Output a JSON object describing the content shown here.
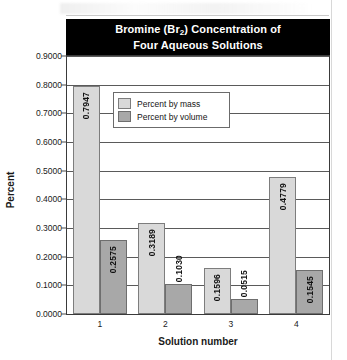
{
  "chart_data": {
    "type": "bar",
    "title": "Bromine (Br2) Concentration of Four Aqueous Solutions",
    "title_line1": "Bromine (Br",
    "title_sub": "2",
    "title_line1_tail": ") Concentration of",
    "title_line2": "Four Aqueous Solutions",
    "xlabel": "Solution number",
    "ylabel": "Percent",
    "categories": [
      "1",
      "2",
      "3",
      "4"
    ],
    "ylim": [
      0.0,
      0.9
    ],
    "ytick_step": 0.1,
    "ytick_labels": [
      "0.9000",
      "0.8000",
      "0.7000",
      "0.6000",
      "0.5000",
      "0.4000",
      "0.3000",
      "0.2000",
      "0.1000",
      "0.0000"
    ],
    "grid": true,
    "legend_position": "inside-top-left",
    "series": [
      {
        "name": "Percent by mass",
        "color": "#d9d9d9",
        "values": [
          0.7947,
          0.3189,
          0.1596,
          0.4779
        ],
        "labels": [
          "0.7947",
          "0.3189",
          "0.1596",
          "0.4779"
        ]
      },
      {
        "name": "Percent by volume",
        "color": "#a8a8a8",
        "values": [
          0.2575,
          0.103,
          0.0515,
          0.1545
        ],
        "labels": [
          "0.2575",
          "0.1030",
          "0.0515",
          "0.1545"
        ]
      }
    ]
  },
  "legend": {
    "entries": [
      {
        "label": "Percent by mass"
      },
      {
        "label": "Percent by volume"
      }
    ]
  }
}
